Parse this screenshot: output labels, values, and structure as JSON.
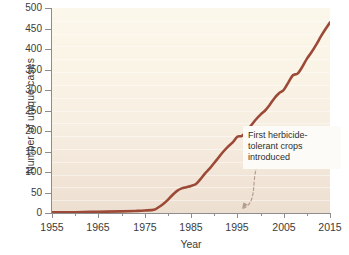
{
  "chart_data": {
    "type": "line",
    "title": "",
    "xlabel": "Year",
    "ylabel": "Number of unique cases",
    "xlim": [
      1955,
      2015
    ],
    "ylim": [
      0,
      500
    ],
    "xticks": [
      1955,
      1965,
      1975,
      1985,
      1995,
      2005,
      2015
    ],
    "xticks_minor": [
      1960,
      1970,
      1980,
      1990,
      2000,
      2010
    ],
    "yticks": [
      0,
      50,
      100,
      150,
      200,
      250,
      300,
      350,
      400,
      450,
      500
    ],
    "grid": false,
    "legend": "none",
    "series": [
      {
        "name": "Unique cases of herbicide resistance",
        "color": "#9c4a37",
        "x": [
          1955,
          1960,
          1965,
          1970,
          1973,
          1975,
          1977,
          1978,
          1979,
          1980,
          1981,
          1982,
          1983,
          1984,
          1985,
          1986,
          1987,
          1988,
          1989,
          1990,
          1991,
          1992,
          1993,
          1994,
          1995,
          1996,
          1997,
          1998,
          1999,
          2000,
          2001,
          2002,
          2003,
          2004,
          2005,
          2006,
          2007,
          2008,
          2009,
          2010,
          2011,
          2012,
          2013,
          2014,
          2015
        ],
        "y": [
          2,
          2,
          3,
          4,
          5,
          6,
          8,
          14,
          22,
          32,
          44,
          54,
          60,
          63,
          66,
          70,
          82,
          96,
          108,
          122,
          136,
          150,
          162,
          172,
          186,
          188,
          200,
          214,
          228,
          240,
          250,
          264,
          280,
          292,
          300,
          318,
          336,
          340,
          356,
          376,
          392,
          410,
          430,
          448,
          465
        ]
      }
    ],
    "annotations": [
      {
        "text_lines": [
          "First herbicide-",
          "tolerant crops",
          "introduced"
        ],
        "points_to_year": 1996,
        "points_to_value": 0,
        "connector": "dashed-curved-arrow"
      }
    ]
  },
  "axes": {
    "ylabel": "Number of unique cases",
    "xlabel": "Year",
    "ytick_labels": [
      "500",
      "450",
      "400",
      "350",
      "300",
      "250",
      "200",
      "150",
      "100",
      "50",
      "0"
    ],
    "xtick_labels": [
      "1955",
      "1965",
      "1975",
      "1985",
      "1995",
      "2005",
      "2015"
    ]
  },
  "annotation": {
    "line1": "First herbicide-",
    "line2": "tolerant crops",
    "line3": "introduced"
  },
  "colors": {
    "line": "#9c4a37",
    "plot_background_top": "#fbf7ea",
    "plot_background_bottom": "#eddfd0",
    "axis": "#8d8d8d",
    "text": "#3b3b3b",
    "annotation_background": "#fcfbf7",
    "connector": "#b09a8e"
  }
}
